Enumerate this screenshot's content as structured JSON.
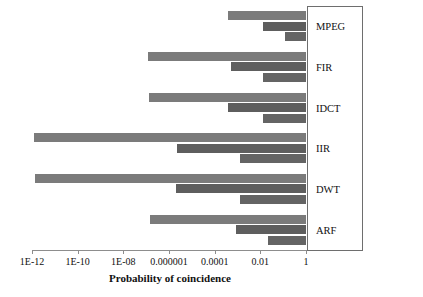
{
  "chart_data": {
    "type": "bar",
    "orientation": "horizontal",
    "title": "",
    "xlabel": "Probability of coincidence",
    "ylabel": "",
    "xscale": "log",
    "xlim": [
      1e-12,
      1
    ],
    "grid": false,
    "legend_position": "right-box-labels",
    "categories": [
      "MPEG",
      "FIR",
      "IDCT",
      "IIR",
      "DWT",
      "ARF"
    ],
    "xtick_labels": [
      "1E-12",
      "1E-10",
      "1E-08",
      "0.000001",
      "0.0001",
      "0.01",
      "1"
    ],
    "xtick_values": [
      1e-12,
      1e-10,
      1e-08,
      1e-06,
      0.0001,
      0.01,
      1
    ],
    "series": [
      {
        "name": "series-1",
        "color": "#7b7b7b",
        "values": [
          0.0004,
          1.2e-07,
          1.3e-07,
          1.2e-12,
          1.4e-12,
          1.5e-07
        ]
      },
      {
        "name": "series-2",
        "color": "#5e5e5e",
        "values": [
          0.013,
          0.0005,
          0.0004,
          2.2e-06,
          2e-06,
          0.0009
        ]
      },
      {
        "name": "series-3",
        "color": "#646464",
        "values": [
          0.12,
          0.013,
          0.013,
          0.0013,
          0.0013,
          0.022
        ]
      }
    ]
  }
}
